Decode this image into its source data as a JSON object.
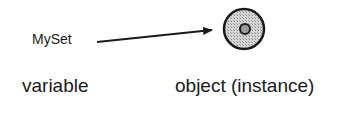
{
  "diagram": {
    "variable_name": "MySet",
    "caption_left": "variable",
    "caption_right": "object (instance)",
    "colors": {
      "ink": "#1a1a1a",
      "object_fill": "#bdbdbd",
      "object_core": "#9a9a9a",
      "background": "#ffffff"
    }
  }
}
